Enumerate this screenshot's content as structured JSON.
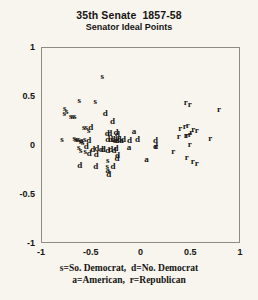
{
  "chart_data": {
    "type": "scatter",
    "title": "35th Senate  1857-58",
    "subtitle": "Senator Ideal Points",
    "xlabel": "",
    "ylabel": "",
    "xlim": [
      -1,
      1
    ],
    "ylim": [
      -1,
      1
    ],
    "grid": false,
    "legend_position": "below-plot",
    "xticks": [
      "-1",
      "-0.5",
      "0",
      "0.5",
      "1"
    ],
    "xtick_values": [
      -1,
      -0.5,
      0,
      0.5,
      1
    ],
    "yticks": [
      "1",
      "0.5",
      "0",
      "-0.5",
      "-1"
    ],
    "ytick_values": [
      1,
      0.5,
      0,
      -0.5,
      -1
    ],
    "marker_style": "text-letter",
    "legend_lines": [
      "s=So. Democrat,  d=No. Democrat",
      "a=American,  r=Republican"
    ],
    "legend_entries": [
      {
        "symbol": "s",
        "label": "So. Democrat"
      },
      {
        "symbol": "d",
        "label": "No. Democrat"
      },
      {
        "symbol": "a",
        "label": "American"
      },
      {
        "symbol": "r",
        "label": "Republican"
      }
    ],
    "series": [
      {
        "name": "So. Democrat",
        "symbol": "s",
        "points": [
          [
            -0.385,
            0.7
          ],
          [
            -0.615,
            0.455
          ],
          [
            -0.76,
            0.375
          ],
          [
            -0.74,
            0.35
          ],
          [
            -0.765,
            0.33
          ],
          [
            -0.455,
            0.445
          ],
          [
            -0.7,
            0.3
          ],
          [
            -0.68,
            0.3
          ],
          [
            -0.66,
            0.295
          ],
          [
            -0.57,
            0.185
          ],
          [
            -0.545,
            0.185
          ],
          [
            -0.52,
            0.155
          ],
          [
            -0.79,
            0.06
          ],
          [
            -0.665,
            0.075
          ],
          [
            -0.65,
            0.065
          ],
          [
            -0.635,
            0.06
          ],
          [
            -0.62,
            0.06
          ],
          [
            -0.6,
            0.04
          ],
          [
            -0.58,
            0.03
          ],
          [
            -0.56,
            0.06
          ],
          [
            -0.62,
            -0.02
          ],
          [
            -0.6,
            -0.05
          ],
          [
            -0.555,
            -0.06
          ],
          [
            -0.335,
            -0.215
          ],
          [
            -0.33,
            -0.155
          ]
        ]
      },
      {
        "name": "No. Democrat",
        "symbol": "d",
        "points": [
          [
            -0.355,
            0.325
          ],
          [
            -0.28,
            0.245
          ],
          [
            -0.5,
            0.18
          ],
          [
            -0.335,
            0.125
          ],
          [
            -0.31,
            0.12
          ],
          [
            -0.245,
            0.135
          ],
          [
            -0.23,
            0.115
          ],
          [
            -0.33,
            0.065
          ],
          [
            -0.3,
            0.06
          ],
          [
            -0.275,
            0.06
          ],
          [
            -0.255,
            0.055
          ],
          [
            -0.235,
            0.055
          ],
          [
            -0.215,
            0.06
          ],
          [
            -0.17,
            0.06
          ],
          [
            -0.11,
            0.055
          ],
          [
            -0.03,
            0.06
          ],
          [
            -0.52,
            0.055
          ],
          [
            -0.545,
            -0.015
          ],
          [
            -0.48,
            -0.04
          ],
          [
            -0.44,
            -0.03
          ],
          [
            -0.395,
            -0.045
          ],
          [
            -0.375,
            -0.045
          ],
          [
            -0.33,
            -0.055
          ],
          [
            -0.3,
            -0.04
          ],
          [
            -0.265,
            -0.055
          ],
          [
            -0.245,
            -0.035
          ],
          [
            -0.23,
            -0.1
          ],
          [
            -0.235,
            -0.13
          ],
          [
            -0.445,
            -0.095
          ],
          [
            -0.515,
            -0.085
          ],
          [
            -0.61,
            -0.205
          ],
          [
            -0.45,
            -0.21
          ],
          [
            -0.275,
            -0.215
          ],
          [
            -0.32,
            -0.3
          ],
          [
            0.15,
            0.05
          ],
          [
            0.15,
            -0.01
          ]
        ]
      },
      {
        "name": "American",
        "symbol": "a",
        "points": [
          [
            -0.065,
            0.145
          ],
          [
            -0.115,
            -0.02
          ],
          [
            0.06,
            -0.14
          ],
          [
            -0.33,
            -0.25
          ],
          [
            -0.595,
            0.055
          ],
          [
            -0.19,
            0.055
          ]
        ]
      },
      {
        "name": "Republican",
        "symbol": "r",
        "points": [
          [
            0.455,
            0.44
          ],
          [
            0.495,
            0.415
          ],
          [
            0.79,
            0.365
          ],
          [
            0.4,
            0.17
          ],
          [
            0.445,
            0.195
          ],
          [
            0.475,
            0.2
          ],
          [
            0.53,
            0.165
          ],
          [
            0.565,
            0.155
          ],
          [
            0.385,
            0.095
          ],
          [
            0.455,
            0.105
          ],
          [
            0.47,
            0.105
          ],
          [
            0.495,
            0.11
          ],
          [
            0.51,
            0.13
          ],
          [
            0.7,
            0.075
          ],
          [
            0.155,
            -0.015
          ],
          [
            0.495,
            0.015
          ],
          [
            0.33,
            -0.06
          ],
          [
            0.465,
            -0.12
          ],
          [
            0.525,
            -0.165
          ],
          [
            0.565,
            -0.18
          ]
        ]
      }
    ]
  }
}
